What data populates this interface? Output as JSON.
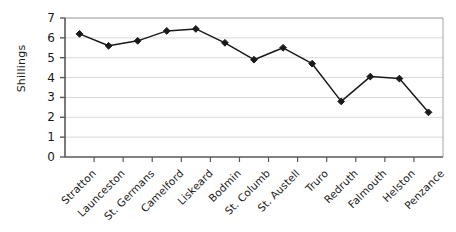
{
  "chart_data": {
    "type": "line",
    "title": "",
    "subtitle": "",
    "xlabel": "",
    "ylabel": "Shillings",
    "ylim": [
      0,
      7
    ],
    "yticks": [
      0,
      1,
      2,
      3,
      4,
      5,
      6,
      7
    ],
    "ytick_labels": [
      "0",
      "1",
      "2",
      "3",
      "4",
      "5",
      "6",
      "7"
    ],
    "grid": "horizontal",
    "legend": "none",
    "marker": "diamond",
    "line_color": "#1a1a1a",
    "marker_color": "#1a1a1a",
    "grid_color": "#d9d9d9",
    "axis_color": "#595959",
    "background": "#ffffff",
    "categories": [
      "Stratton",
      "Launceston",
      "St. Germans",
      "Camelford",
      "Liskeard",
      "Bodmin",
      "St. Columb",
      "St. Austell",
      "Truro",
      "Redruth",
      "Falmouth",
      "Helston",
      "Penzance"
    ],
    "values": [
      6.2,
      5.6,
      5.85,
      6.35,
      6.45,
      5.75,
      4.9,
      5.5,
      4.7,
      2.8,
      4.05,
      3.95,
      2.25
    ],
    "series": [
      {
        "name": "Shillings",
        "values": [
          6.2,
          5.6,
          5.85,
          6.35,
          6.45,
          5.75,
          4.9,
          5.5,
          4.7,
          2.8,
          4.05,
          3.95,
          2.25
        ]
      }
    ]
  }
}
